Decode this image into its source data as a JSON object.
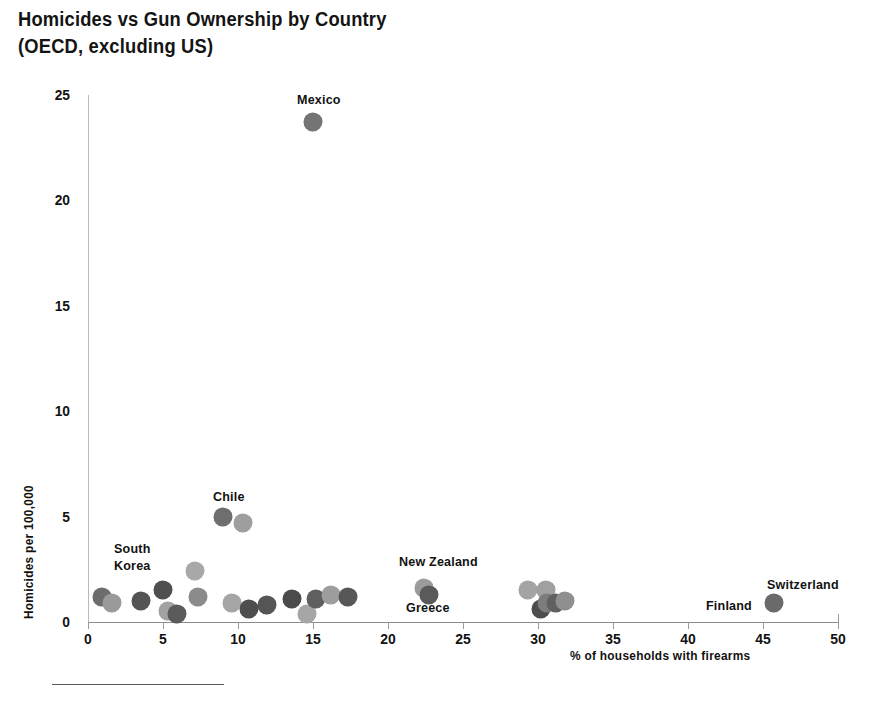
{
  "title": {
    "line1": "Homicides vs Gun Ownership by Country",
    "line2": "(OECD, excluding US)"
  },
  "chart_data": {
    "type": "scatter",
    "title": "Homicides vs Gun Ownership by Country (OECD, excluding US)",
    "xlabel": "% of households with firearms",
    "ylabel": "Homicides per 100,000",
    "xlim": [
      0,
      50
    ],
    "ylim": [
      0,
      25
    ],
    "xticks": [
      0,
      5,
      10,
      15,
      20,
      25,
      30,
      35,
      40,
      45,
      50
    ],
    "yticks": [
      0,
      5,
      10,
      15,
      20,
      25
    ],
    "grid": false,
    "legend": "none",
    "points": [
      {
        "x": 0.9,
        "y": 1.2,
        "color": "#6d6d6d"
      },
      {
        "x": 1.6,
        "y": 0.9,
        "color": "#9a9a9a"
      },
      {
        "x": 3.5,
        "y": 1.0,
        "color": "#545454"
      },
      {
        "x": 5.0,
        "y": 1.5,
        "color": "#4f4f4f"
      },
      {
        "x": 5.3,
        "y": 0.5,
        "color": "#a2a2a2"
      },
      {
        "x": 5.9,
        "y": 0.4,
        "color": "#5b5b5b"
      },
      {
        "x": 7.1,
        "y": 2.4,
        "color": "#a8a8a8"
      },
      {
        "x": 7.3,
        "y": 1.2,
        "color": "#8b8b8b"
      },
      {
        "x": 9.0,
        "y": 5.0,
        "color": "#6e6e6e"
      },
      {
        "x": 10.3,
        "y": 4.7,
        "color": "#9e9e9e"
      },
      {
        "x": 9.6,
        "y": 0.9,
        "color": "#a5a5a5"
      },
      {
        "x": 10.7,
        "y": 0.6,
        "color": "#4e4e4e"
      },
      {
        "x": 11.9,
        "y": 0.8,
        "color": "#555555"
      },
      {
        "x": 13.6,
        "y": 1.1,
        "color": "#4b4b4b"
      },
      {
        "x": 14.6,
        "y": 0.4,
        "color": "#a6a6a6"
      },
      {
        "x": 15.2,
        "y": 1.1,
        "color": "#5f5f5f"
      },
      {
        "x": 16.2,
        "y": 1.3,
        "color": "#9d9d9d"
      },
      {
        "x": 17.3,
        "y": 1.2,
        "color": "#575757"
      },
      {
        "x": 22.4,
        "y": 1.6,
        "color": "#9b9b9b"
      },
      {
        "x": 22.7,
        "y": 1.3,
        "color": "#5a5a5a"
      },
      {
        "x": 29.3,
        "y": 1.5,
        "color": "#a4a4a4"
      },
      {
        "x": 30.5,
        "y": 1.5,
        "color": "#a0a0a0"
      },
      {
        "x": 30.2,
        "y": 0.6,
        "color": "#4d4d4d"
      },
      {
        "x": 30.6,
        "y": 0.9,
        "color": "#7c7c7c"
      },
      {
        "x": 31.2,
        "y": 0.9,
        "color": "#606060"
      },
      {
        "x": 31.8,
        "y": 1.0,
        "color": "#8f8f8f"
      },
      {
        "x": 15.0,
        "y": 23.7,
        "color": "#747474"
      },
      {
        "x": 45.7,
        "y": 0.9,
        "color": "#6a6a6a"
      }
    ],
    "annotations": [
      {
        "label": "Mexico",
        "x": 15.0,
        "y": 23.7
      },
      {
        "label": "Chile",
        "x": 9.0,
        "y": 5.0
      },
      {
        "label": "South\nKorea",
        "x": 0.9,
        "y": 1.2
      },
      {
        "label": "New Zealand",
        "x": 22.5,
        "y": 1.6
      },
      {
        "label": "Greece",
        "x": 22.7,
        "y": 1.3
      },
      {
        "label": "Finland",
        "x": 45.7,
        "y": 0.9
      },
      {
        "label": "Switzerland",
        "x": 45.7,
        "y": 0.9
      }
    ]
  },
  "axis": {
    "x_title": "% of households with firearms",
    "y_title": "Homicides per 100,000",
    "xticks": [
      "0",
      "5",
      "10",
      "15",
      "20",
      "25",
      "30",
      "35",
      "40",
      "45",
      "50"
    ],
    "yticks": [
      "0",
      "5",
      "10",
      "15",
      "20",
      "25"
    ]
  },
  "labels": {
    "mexico": "Mexico",
    "chile": "Chile",
    "south_korea_line1": "South",
    "south_korea_line2": "Korea",
    "new_zealand": "New Zealand",
    "greece": "Greece",
    "finland": "Finland",
    "switzerland": "Switzerland"
  }
}
